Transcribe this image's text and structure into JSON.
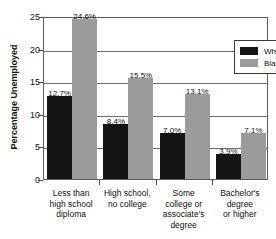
{
  "chart_data": {
    "type": "bar",
    "title": "",
    "xlabel": "",
    "ylabel": "Percentage Unemployed",
    "ylim": [
      0,
      25
    ],
    "yticks": [
      0,
      5,
      10,
      15,
      20,
      25
    ],
    "ytick_labels": [
      "0",
      "5",
      "10",
      "15",
      "20",
      "25"
    ],
    "grid": true,
    "legend_position": "top-right",
    "categories": [
      "Less than\nhigh school\ndiploma",
      "High school,\nno college",
      "Some\ncollege or\nassociate's\ndegree",
      "Bachelor's\ndegree\nor higher"
    ],
    "category_lines": [
      [
        "Less than",
        "high school",
        "diploma"
      ],
      [
        "High school,",
        "no college"
      ],
      [
        "Some",
        "college or",
        "associate's",
        "degree"
      ],
      [
        "Bachelor's",
        "degree",
        "or higher"
      ]
    ],
    "series": [
      {
        "name": "White",
        "color": "#151515",
        "values": [
          12.7,
          8.4,
          7.0,
          3.9
        ],
        "value_labels": [
          "12.7%",
          "8.4%",
          "7.0%",
          "3.9%"
        ]
      },
      {
        "name": "Black",
        "color": "#9b9b9b",
        "values": [
          24.6,
          15.5,
          13.1,
          7.1
        ],
        "value_labels": [
          "24.6%",
          "15.5%",
          "13.1%",
          "7.1%"
        ]
      }
    ]
  },
  "legend": {
    "entries": [
      {
        "label": "White",
        "swatch": "#151515"
      },
      {
        "label": "Black",
        "swatch": "#9b9b9b"
      }
    ]
  },
  "colors": {
    "white_series": "#151515",
    "black_series": "#9b9b9b",
    "axis": "#5a5a5a",
    "grid": "#6e6e6e",
    "text": "#111111",
    "background": "#ffffff"
  }
}
